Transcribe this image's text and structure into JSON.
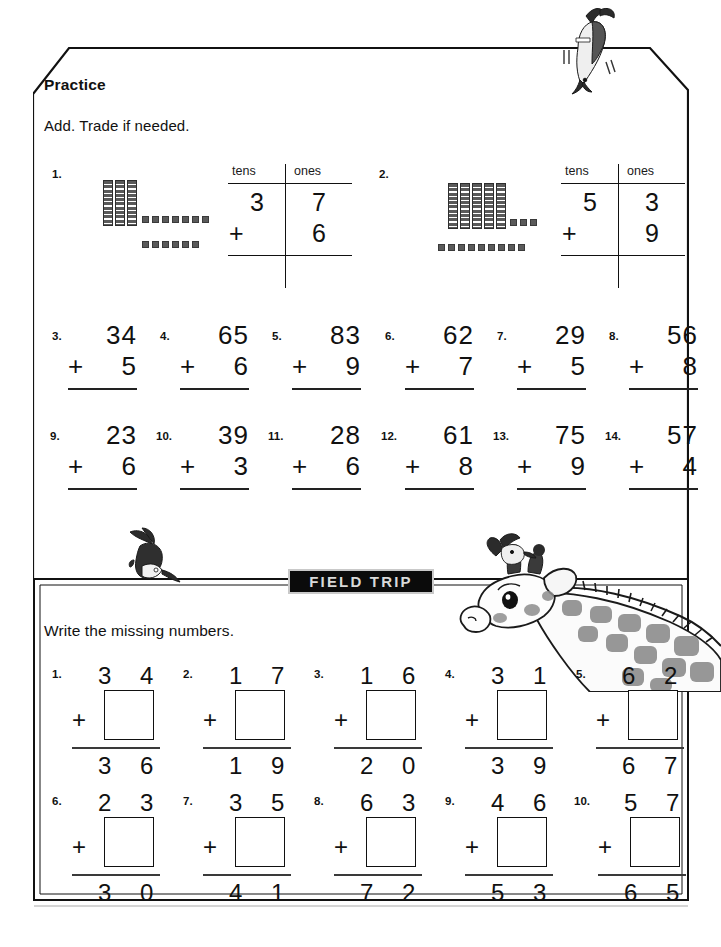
{
  "worksheet": {
    "practice_heading": "Practice",
    "practice_instruction": "Add. Trade if needed.",
    "banner_label": "FIELD TRIP",
    "missing_instruction": "Write the missing numbers."
  },
  "place_value_headers": {
    "tens": "tens",
    "ones": "ones"
  },
  "place_value_problems": [
    {
      "number": "1.",
      "tens_digit": "3",
      "ones_digit": "7",
      "operator": "+",
      "addend_ones": "6",
      "blocks": {
        "rods": 3,
        "units_row1": 7,
        "units_row2": 6
      }
    },
    {
      "number": "2.",
      "tens_digit": "5",
      "ones_digit": "3",
      "operator": "+",
      "addend_ones": "9",
      "blocks": {
        "rods": 5,
        "units_row1": 3,
        "units_row2": 9
      }
    }
  ],
  "add_problems": [
    {
      "number": "3.",
      "top": "34",
      "operator": "+",
      "bottom": "5"
    },
    {
      "number": "4.",
      "top": "65",
      "operator": "+",
      "bottom": "6"
    },
    {
      "number": "5.",
      "top": "83",
      "operator": "+",
      "bottom": "9"
    },
    {
      "number": "6.",
      "top": "62",
      "operator": "+",
      "bottom": "7"
    },
    {
      "number": "7.",
      "top": "29",
      "operator": "+",
      "bottom": "5"
    },
    {
      "number": "8.",
      "top": "56",
      "operator": "+",
      "bottom": "8"
    },
    {
      "number": "9.",
      "top": "23",
      "operator": "+",
      "bottom": "6"
    },
    {
      "number": "10.",
      "top": "39",
      "operator": "+",
      "bottom": "3"
    },
    {
      "number": "11.",
      "top": "28",
      "operator": "+",
      "bottom": "6"
    },
    {
      "number": "12.",
      "top": "61",
      "operator": "+",
      "bottom": "8"
    },
    {
      "number": "13.",
      "top": "75",
      "operator": "+",
      "bottom": "9"
    },
    {
      "number": "14.",
      "top": "57",
      "operator": "+",
      "bottom": "4"
    }
  ],
  "missing_problems": [
    {
      "number": "1.",
      "addend": "3 4",
      "operator": "+",
      "answer": "",
      "sum": "3 6"
    },
    {
      "number": "2.",
      "addend": "1 7",
      "operator": "+",
      "answer": "",
      "sum": "1 9"
    },
    {
      "number": "3.",
      "addend": "1 6",
      "operator": "+",
      "answer": "",
      "sum": "2 0"
    },
    {
      "number": "4.",
      "addend": "3 1",
      "operator": "+",
      "answer": "",
      "sum": "3 9"
    },
    {
      "number": "5.",
      "addend": "6 2",
      "operator": "+",
      "answer": "",
      "sum": "6 7"
    },
    {
      "number": "6.",
      "addend": "2 3",
      "operator": "+",
      "answer": "",
      "sum": "3 0"
    },
    {
      "number": "7.",
      "addend": "3 5",
      "operator": "+",
      "answer": "",
      "sum": "4 1"
    },
    {
      "number": "8.",
      "addend": "6 3",
      "operator": "+",
      "answer": "",
      "sum": "7 2"
    },
    {
      "number": "9.",
      "addend": "4 6",
      "operator": "+",
      "answer": "",
      "sum": "5 3"
    },
    {
      "number": "10.",
      "addend": "5 7",
      "operator": "+",
      "answer": "",
      "sum": "6 5"
    }
  ],
  "illustrations": [
    {
      "name": "bird-top-right"
    },
    {
      "name": "bird-divider-left"
    },
    {
      "name": "giraffe-with-bird"
    }
  ],
  "colors": {
    "ink": "#111111",
    "banner_background": "#0b0b0b",
    "banner_text": "#d9d9d9",
    "block_fill": "#5a5a5a"
  }
}
